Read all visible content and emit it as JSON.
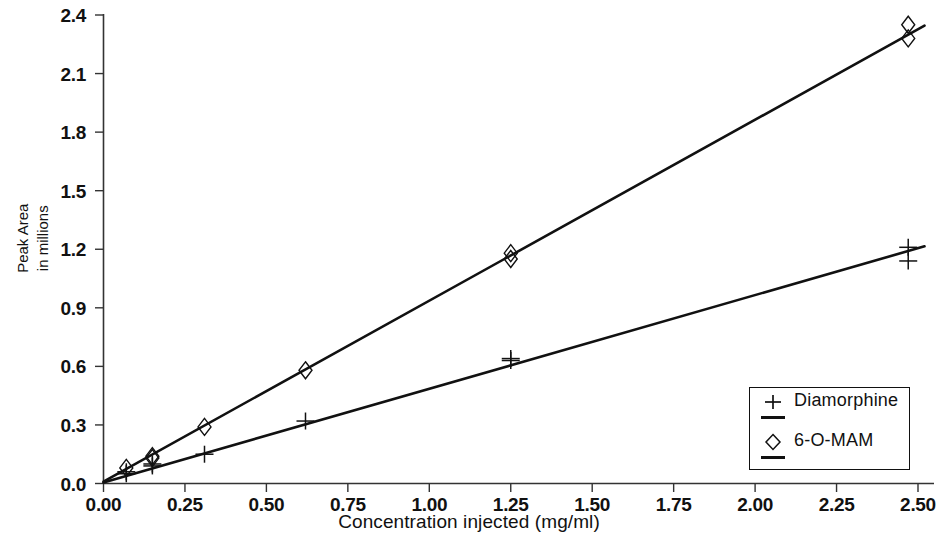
{
  "chart_data": {
    "type": "scatter",
    "title": "",
    "xlabel": "Concentration injected (mg/ml)",
    "ylabel_line1": "Peak Area",
    "ylabel_line2": "in millions",
    "xlim": [
      0.0,
      2.6
    ],
    "ylim": [
      0.0,
      2.45
    ],
    "xticks": [
      "0.00",
      "0.25",
      "0.50",
      "0.75",
      "1.00",
      "1.25",
      "1.50",
      "1.75",
      "2.00",
      "2.25",
      "2.50"
    ],
    "xtick_values": [
      0.0,
      0.25,
      0.5,
      0.75,
      1.0,
      1.25,
      1.5,
      1.75,
      2.0,
      2.25,
      2.5
    ],
    "yticks": [
      "0.0",
      "0.3",
      "0.6",
      "0.9",
      "1.2",
      "1.5",
      "1.8",
      "2.1",
      "2.4"
    ],
    "ytick_values": [
      0.0,
      0.3,
      0.6,
      0.9,
      1.2,
      1.5,
      1.8,
      2.1,
      2.4
    ],
    "grid": false,
    "legend_position": "bottom-right",
    "series": [
      {
        "name": "Diamorphine",
        "marker": "plus",
        "color": "#111111",
        "x": [
          0.07,
          0.07,
          0.15,
          0.15,
          0.31,
          0.62,
          1.25,
          1.25,
          2.47,
          2.47
        ],
        "y": [
          0.06,
          0.05,
          0.1,
          0.09,
          0.15,
          0.32,
          0.64,
          0.63,
          1.21,
          1.14
        ],
        "fit_line": {
          "x0": 0.0,
          "y0": 0.005,
          "x1": 2.52,
          "y1": 1.215
        }
      },
      {
        "name": "6-O-MAM",
        "marker": "diamond",
        "color": "#111111",
        "x": [
          0.07,
          0.15,
          0.15,
          0.31,
          0.62,
          1.25,
          1.25,
          2.47,
          2.47
        ],
        "y": [
          0.08,
          0.14,
          0.13,
          0.29,
          0.58,
          1.18,
          1.15,
          2.35,
          2.28
        ],
        "fit_line": {
          "x0": 0.0,
          "y0": 0.01,
          "x1": 2.52,
          "y1": 2.345
        }
      }
    ]
  },
  "legend": {
    "items": [
      {
        "label": "Diamorphine",
        "marker": "plus-marker-icon"
      },
      {
        "label": "6-O-MAM",
        "marker": "diamond-marker-icon"
      }
    ]
  }
}
